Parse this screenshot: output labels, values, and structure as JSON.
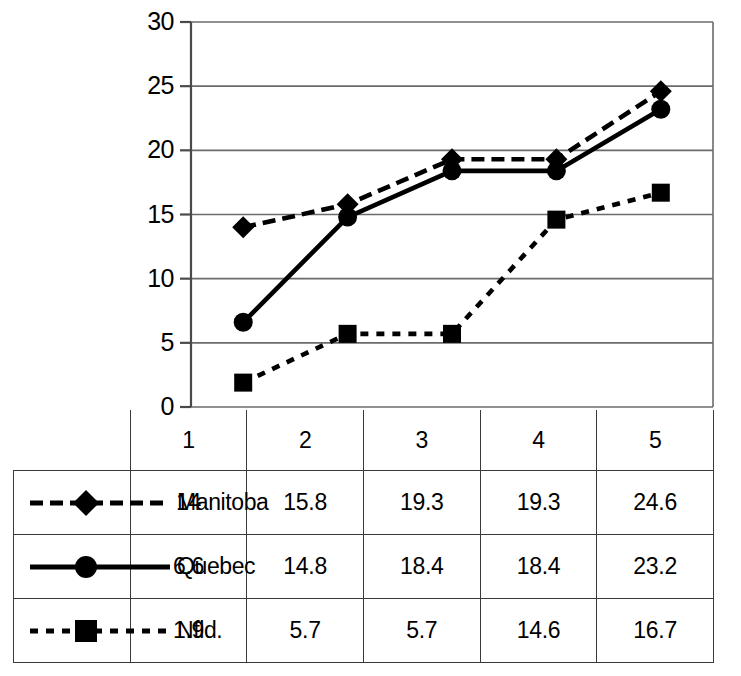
{
  "chart_data": {
    "type": "line",
    "title": "",
    "xlabel": "",
    "ylabel": "",
    "categories": [
      "1",
      "2",
      "3",
      "4",
      "5"
    ],
    "ylim": [
      0,
      30
    ],
    "yticks": [
      0,
      5,
      10,
      15,
      20,
      25,
      30
    ],
    "ytick_labels": [
      "0",
      "5",
      "10",
      "15",
      "20",
      "25",
      "30"
    ],
    "grid": "horizontal",
    "legend_position": "table-row-headers",
    "series": [
      {
        "name": "Manitoba",
        "values": [
          14,
          15.8,
          19.3,
          19.3,
          24.6
        ],
        "marker": "diamond",
        "line_style": "dashed",
        "color": "#000000"
      },
      {
        "name": "Quebec",
        "values": [
          6.6,
          14.8,
          18.4,
          18.4,
          23.2
        ],
        "marker": "circle",
        "line_style": "solid",
        "color": "#000000"
      },
      {
        "name": "Nfld.",
        "values": [
          1.9,
          5.7,
          5.7,
          14.6,
          16.7
        ],
        "marker": "square",
        "line_style": "dotted",
        "color": "#000000"
      }
    ]
  },
  "table": {
    "header": [
      "",
      "1",
      "2",
      "3",
      "4",
      "5"
    ],
    "rows": [
      {
        "label": "Manitoba",
        "cells": [
          "14",
          "15.8",
          "19.3",
          "19.3",
          "24.6"
        ]
      },
      {
        "label": "Quebec",
        "cells": [
          "6.6",
          "14.8",
          "18.4",
          "18.4",
          "23.2"
        ]
      },
      {
        "label": "Nfld.",
        "cells": [
          "1.9",
          "5.7",
          "5.7",
          "14.6",
          "16.7"
        ]
      }
    ]
  },
  "colors": {
    "ink": "#000000",
    "grid": "#6b6b6b",
    "table_border": "#3a3a3a",
    "background": "#ffffff"
  }
}
